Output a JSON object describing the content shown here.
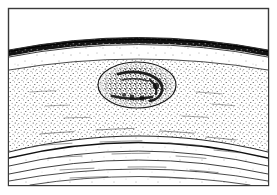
{
  "figure": {
    "title": "Stratigraphic Cross-Section with Lenticular Body",
    "type": "geological-cross-section",
    "width": 277,
    "height": 195,
    "background_color": "#ffffff",
    "ink_color": "#1a1a1a"
  },
  "frame": {
    "name": "outer-border",
    "x": 8,
    "y": 8,
    "width": 261,
    "height": 178,
    "stroke_color": "#3a3a3a",
    "stroke_width": 1.4,
    "fill_color": "#ffffff"
  },
  "layers": [
    {
      "id": "void-top",
      "label": "Upper void / unfilled wedge",
      "fill_color": "#ffffff",
      "stipple": "none",
      "stipple_density": 0
    },
    {
      "id": "caprock-dark-band",
      "label": "Dark caprock band",
      "fill_color": "#111111",
      "stipple": "solid-textured",
      "stipple_density": 100,
      "crest_y": 33,
      "thickness": 4
    },
    {
      "id": "upper-sparse-stratum",
      "label": "Upper sparse-stipple stratum",
      "fill_color": "#ffffff",
      "stipple": "sparse",
      "stipple_density": 14,
      "crest_y": 44
    },
    {
      "id": "main-dense-stratum",
      "label": "Main dense-stipple stratum",
      "fill_color": "#ffffff",
      "stipple": "dense",
      "stipple_density": 62,
      "crest_y": 62
    },
    {
      "id": "lower-laminated-stratum",
      "label": "Lower laminated stratum",
      "fill_color": "#ffffff",
      "stipple": "very-sparse",
      "stipple_density": 8,
      "crest_y": 126
    }
  ],
  "boundary_arcs": [
    {
      "id": "arc-caprock-top",
      "crest_y": 31,
      "edge_y": 56,
      "stroke_width": 1.0
    },
    {
      "id": "arc-caprock-base",
      "crest_y": 38,
      "edge_y": 62,
      "stroke_width": 0.9
    },
    {
      "id": "arc-sparse-base",
      "crest_y": 45,
      "edge_y": 70,
      "stroke_width": 0.8
    },
    {
      "id": "arc-dense-top",
      "crest_y": 62,
      "edge_y": 100,
      "stroke_width": 1.0
    },
    {
      "id": "arc-dense-base",
      "crest_y": 125,
      "edge_y": 152,
      "stroke_width": 1.2
    },
    {
      "id": "arc-lam-1",
      "crest_y": 133,
      "edge_y": 158,
      "stroke_width": 1.3
    },
    {
      "id": "arc-lam-2",
      "crest_y": 142,
      "edge_y": 166,
      "stroke_width": 0.9
    },
    {
      "id": "arc-lam-3",
      "crest_y": 152,
      "edge_y": 174,
      "stroke_width": 0.9
    },
    {
      "id": "arc-lam-4",
      "crest_y": 163,
      "edge_y": 181,
      "stroke_width": 0.9
    },
    {
      "id": "arc-lam-5",
      "crest_y": 172,
      "edge_y": 185,
      "stroke_width": 0.8
    }
  ],
  "lens_feature": {
    "name": "central-elliptical-lens",
    "label": "Central elliptical lens / nodule",
    "center_x": 137,
    "center_y": 85,
    "radius_x": 39,
    "radius_y": 23,
    "stroke_color": "#1a1a1a",
    "stroke_width": 1.2,
    "fill_color": "none",
    "core": {
      "name": "dark-crescent-core",
      "label": "Dense dark crescent cluster",
      "density": 95,
      "color": "#0d0d0d"
    }
  },
  "texture": {
    "stipple_dot_color": "#2b2b2b",
    "dash_mark_color": "#555555",
    "dash_mark_count": 34
  }
}
